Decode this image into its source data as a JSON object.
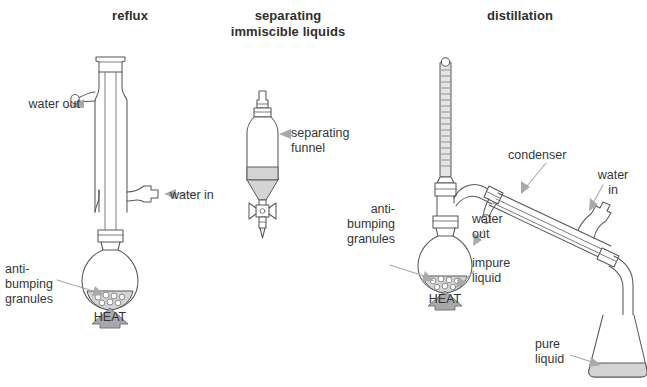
{
  "figure": {
    "background_color": "#ffffff",
    "stroke_color": "#58595b",
    "liquid_color": "#d4d4d4",
    "leader_color": "#a7a9ac",
    "heading_color": "#2f2f2f",
    "label_color": "#363636"
  },
  "panels": [
    {
      "id": "reflux",
      "heading": "reflux",
      "labels": {
        "water_out": "water out",
        "water_in": "water in",
        "anti_bumping": "anti-\nbumping\ngranules",
        "heat": "HEAT"
      }
    },
    {
      "id": "separating",
      "heading": "separating\nimmiscible\nliquids",
      "labels": {
        "funnel": "separating\nfunnel"
      }
    },
    {
      "id": "distillation",
      "heading": "distillation",
      "labels": {
        "condenser": "condenser",
        "water_in": "water\nin",
        "water_out": "water\nout",
        "anti_bumping": "anti-\nbumping\ngranules",
        "impure_liquid": "impure\nliquid",
        "pure_liquid": "pure\nliquid",
        "heat": "HEAT"
      }
    }
  ]
}
